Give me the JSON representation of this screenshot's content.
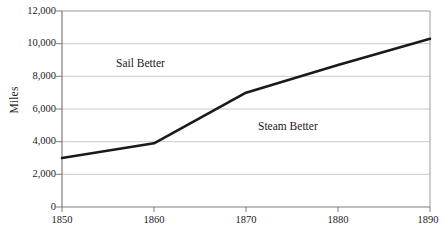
{
  "chart_data": {
    "type": "line",
    "title": "",
    "subtitle": "",
    "xlabel": "",
    "ylabel": "Miles",
    "x": [
      1850,
      1860,
      1870,
      1880,
      1890
    ],
    "series": [
      {
        "name": "Miles",
        "values": [
          3000,
          3900,
          7000,
          8700,
          10300
        ],
        "color": "#1a1a1a"
      }
    ],
    "categories": [
      "1850",
      "1860",
      "1870",
      "1880",
      "1890"
    ],
    "xlim": [
      1850,
      1890
    ],
    "ylim": [
      0,
      12000
    ],
    "x_ticks": [
      1850,
      1860,
      1870,
      1880,
      1890
    ],
    "x_tick_labels": [
      "1850",
      "1860",
      "1870",
      "1880",
      "1890"
    ],
    "y_ticks": [
      0,
      2000,
      4000,
      6000,
      8000,
      10000,
      12000
    ],
    "y_tick_labels": [
      "0",
      "2,000",
      "4,000",
      "6,000",
      "8,000",
      "10,000",
      "12,000"
    ],
    "grid": {
      "horizontal": true,
      "vertical": false,
      "color": "#c9c9c9"
    },
    "legend": {
      "visible": false,
      "position": "none",
      "entries": []
    },
    "annotations": [
      {
        "text": "Sail Better",
        "x": 1856.5,
        "y": 8900
      },
      {
        "text": "Steam Better",
        "x": 1871.5,
        "y": 5250
      }
    ],
    "axis_color": "#8a8a8a",
    "background_color": "#ffffff",
    "line_width": 2.6
  },
  "axis": {
    "y_title": "Miles"
  },
  "annotations": {
    "sail_better": "Sail Better",
    "steam_better": "Steam Better"
  },
  "y_tick_labels": {
    "t0": "0",
    "t1": "2,000",
    "t2": "4,000",
    "t3": "6,000",
    "t4": "8,000",
    "t5": "10,000",
    "t6": "12,000"
  },
  "x_tick_labels": {
    "t0": "1850",
    "t1": "1860",
    "t2": "1870",
    "t3": "1880",
    "t4": "1890"
  }
}
